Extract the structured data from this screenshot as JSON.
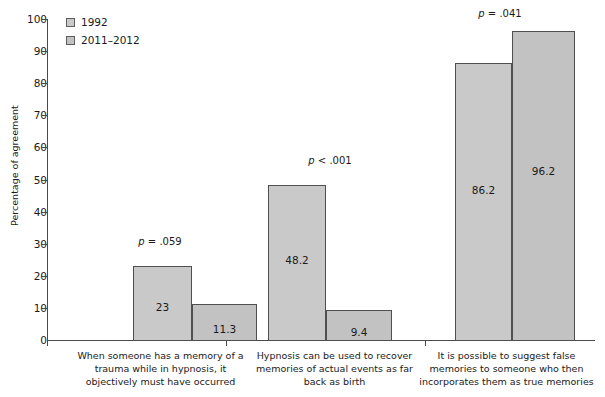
{
  "chart_data": {
    "type": "bar",
    "title": "",
    "xlabel": "",
    "ylabel": "Percentage of agreement",
    "ylim": [
      0,
      100
    ],
    "yticks": [
      0,
      10,
      20,
      30,
      40,
      50,
      60,
      70,
      80,
      90,
      100
    ],
    "ytick_labels": [
      "0",
      "10",
      "20",
      "30",
      "40",
      "50",
      "60",
      "70",
      "80",
      "90",
      "100"
    ],
    "grid": false,
    "legend_position": "top-left",
    "categories": [
      "When someone has a memory of a trauma while in hypnosis, it objectively must have occurred",
      "Hypnosis can be used to recover memories of actual events as far back as birth",
      "It is possible to suggest false memories to someone who then incorporates them as true memories"
    ],
    "category_lines": [
      [
        "When someone has a memory of a",
        "trauma while in hypnosis, it",
        "objectively must have occurred"
      ],
      [
        "Hypnosis can be used to recover",
        "memories of actual events as far",
        "back as birth"
      ],
      [
        "It is possible to suggest false",
        "memories to someone who then",
        "incorporates them as true memories"
      ]
    ],
    "series": [
      {
        "name": "1992",
        "color": "#c9c9c9",
        "values": [
          23,
          48.2,
          86.2
        ],
        "value_labels": [
          "23",
          "48.2",
          "86.2"
        ]
      },
      {
        "name": "2011–2012",
        "color": "#c2c2c2",
        "values": [
          11.3,
          9.4,
          96.2
        ],
        "value_labels": [
          "11.3",
          "9.4",
          "96.2"
        ]
      }
    ],
    "annotations": [
      {
        "text_italic": "p",
        "text_rest": " = .059",
        "category_index": 0
      },
      {
        "text_italic": "p",
        "text_rest": " < .001",
        "category_index": 1
      },
      {
        "text_italic": "p",
        "text_rest": " = .041",
        "category_index": 2
      }
    ]
  },
  "legend": {
    "items": [
      {
        "label": "1992",
        "color": "#c9c9c9"
      },
      {
        "label": "2011–2012",
        "color": "#c2c2c2"
      }
    ]
  },
  "axis": {
    "y_title": "Percentage of agreement"
  }
}
